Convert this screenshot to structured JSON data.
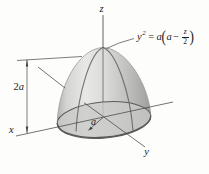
{
  "figure": {
    "labels": {
      "z_axis": "z",
      "x_axis": "x",
      "y_axis": "y",
      "height_coefficient": "2",
      "height_variable": "a",
      "radius": "a"
    },
    "equation": {
      "lhs_var": "y",
      "lhs_exponent": "2",
      "equals_sign": "=",
      "outer_coefficient": "a",
      "open_paren": "(",
      "inner_term": "a",
      "minus_sign": "−",
      "fraction_numerator": "z",
      "fraction_denominator": "2",
      "close_paren": ")"
    },
    "colors": {
      "background": "#fdfdfc",
      "surface_highlight": "#e8e8e6",
      "surface_shadow": "#9e9e9c",
      "base_disk": "#c9c9c7",
      "line": "#454543",
      "text": "#1c1c1a"
    }
  }
}
